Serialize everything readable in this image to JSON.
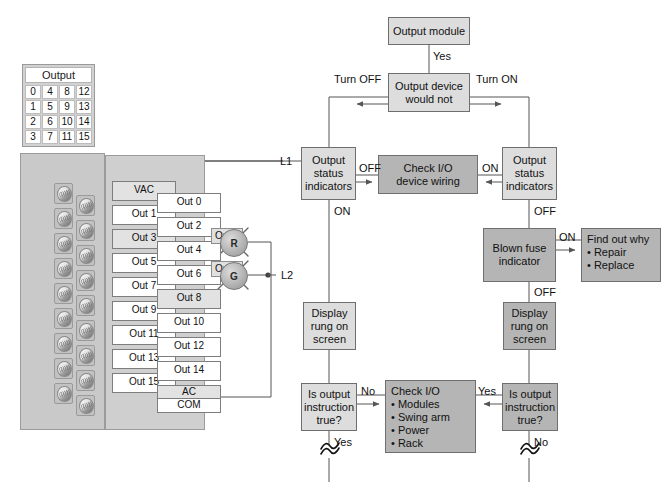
{
  "output_table": {
    "header": "Output",
    "rows": [
      [
        "0",
        "4",
        "8",
        "12"
      ],
      [
        "1",
        "5",
        "9",
        "13"
      ],
      [
        "2",
        "6",
        "10",
        "14"
      ],
      [
        "3",
        "7",
        "11",
        "15"
      ]
    ]
  },
  "terminals": {
    "left": [
      "VAC",
      "Out 1",
      "Out 3",
      "Out 5",
      "Out 7",
      "Out 9",
      "Out 11",
      "Out 13",
      "Out 15"
    ],
    "right": [
      "Out 0",
      "Out 2",
      "Out 4",
      "Out 6",
      "Out 8",
      "Out 10",
      "Out 12",
      "Out 14"
    ],
    "right_extra": [
      "AC",
      "COM"
    ]
  },
  "wiring": {
    "l1": "L1",
    "l2": "L2",
    "lamp_red": {
      "tag": "O:2/3",
      "letter": "R"
    },
    "lamp_green": {
      "tag": "O:2/8",
      "letter": "G"
    }
  },
  "flow": {
    "output_module": "Output module",
    "yes_top": "Yes",
    "output_device_would_not": "Output device\nwould not",
    "turn_off": "Turn OFF",
    "turn_on": "Turn ON",
    "status_left": "Output\nstatus\nindicators",
    "status_right": "Output\nstatus\nindicators",
    "off_left": "OFF",
    "on_right": "ON",
    "check_io_wiring": "Check I/O\ndevice wiring",
    "on_left_down": "ON",
    "off_right_down": "OFF",
    "blown_fuse": "Blown fuse\nindicator",
    "blown_fuse_on": "ON",
    "blown_fuse_off": "OFF",
    "find_out_why": {
      "title": "Find out why",
      "items": [
        "Repair",
        "Replace"
      ]
    },
    "display_rung_left": "Display\nrung on\nscreen",
    "display_rung_right": "Display\nrung on\nscreen",
    "is_output_left": "Is output\ninstruction\ntrue?",
    "is_output_right": "Is output\ninstruction\ntrue?",
    "no_left": "No",
    "yes_left_down": "Yes",
    "yes_right": "Yes",
    "no_right_down": "No",
    "check_io": {
      "title": "Check I/O",
      "items": [
        "Modules",
        "Swing arm",
        "Power",
        "Rack"
      ]
    }
  },
  "colors": {
    "box_light": "#dddddd",
    "box_dark": "#b5b5b5",
    "panel": "#c9c9c9",
    "line": "#555555"
  }
}
